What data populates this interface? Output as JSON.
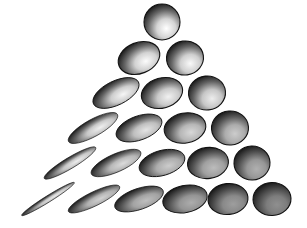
{
  "figure": {
    "title": "Triangular array of shaded ellipsoids",
    "width": 307,
    "height": 228,
    "background_color": "#ffffff",
    "rows": 6,
    "shape_count": 21
  },
  "palette": {
    "background": "#ffffff",
    "rim_dark": "#111111",
    "shade_dark": "#3a3a3a",
    "shade_mid": "#8e8e8e",
    "highlight": "#ffffff",
    "bottom_right_fill": "#6f6f6f"
  },
  "lighting": {
    "highlight_offset_x_pct": 62,
    "highlight_offset_y_pct": 68,
    "rim_direction": "top-left"
  },
  "chart_data": {
    "type": "scatter",
    "title": "Triangular array of shaded ellipsoids",
    "xlabel": "",
    "ylabel": "",
    "xlim": [
      0,
      307
    ],
    "ylim": [
      0,
      228
    ],
    "grid": false,
    "legend": "none",
    "shapes": [
      {
        "id": "r1c1",
        "row": 1,
        "col": 1,
        "cx": 162,
        "cy": 22,
        "rx": 18,
        "ry": 18,
        "angle": 0,
        "dark": 0.0
      },
      {
        "id": "r2c1",
        "row": 2,
        "col": 1,
        "cx": 139,
        "cy": 58,
        "rx": 21.5,
        "ry": 15.5,
        "angle": -22,
        "dark": 0.02
      },
      {
        "id": "r2c2",
        "row": 2,
        "col": 2,
        "cx": 185,
        "cy": 58,
        "rx": 18.5,
        "ry": 17,
        "angle": -8,
        "dark": 0.04
      },
      {
        "id": "r3c1",
        "row": 3,
        "col": 1,
        "cx": 116,
        "cy": 93,
        "rx": 25,
        "ry": 12,
        "angle": -26,
        "dark": 0.06
      },
      {
        "id": "r3c2",
        "row": 3,
        "col": 2,
        "cx": 162,
        "cy": 93,
        "rx": 21,
        "ry": 15,
        "angle": -16,
        "dark": 0.09
      },
      {
        "id": "r3c3",
        "row": 3,
        "col": 3,
        "cx": 207,
        "cy": 93,
        "rx": 18.5,
        "ry": 17,
        "angle": -6,
        "dark": 0.12
      },
      {
        "id": "r4c1",
        "row": 4,
        "col": 1,
        "cx": 93,
        "cy": 128,
        "rx": 28,
        "ry": 8.5,
        "angle": -29,
        "dark": 0.1
      },
      {
        "id": "r4c2",
        "row": 4,
        "col": 2,
        "cx": 139,
        "cy": 128,
        "rx": 24,
        "ry": 12,
        "angle": -20,
        "dark": 0.18
      },
      {
        "id": "r4c3",
        "row": 4,
        "col": 3,
        "cx": 185,
        "cy": 128,
        "rx": 21,
        "ry": 15,
        "angle": -11,
        "dark": 0.26
      },
      {
        "id": "r4c4",
        "row": 4,
        "col": 4,
        "cx": 230,
        "cy": 128,
        "rx": 18.5,
        "ry": 17,
        "angle": -4,
        "dark": 0.34
      },
      {
        "id": "r5c1",
        "row": 5,
        "col": 1,
        "cx": 70,
        "cy": 163,
        "rx": 30,
        "ry": 5.5,
        "angle": -31,
        "dark": 0.12
      },
      {
        "id": "r5c2",
        "row": 5,
        "col": 2,
        "cx": 116,
        "cy": 163,
        "rx": 27,
        "ry": 9,
        "angle": -24,
        "dark": 0.24
      },
      {
        "id": "r5c3",
        "row": 5,
        "col": 3,
        "cx": 162,
        "cy": 163,
        "rx": 23.5,
        "ry": 12.5,
        "angle": -16,
        "dark": 0.34
      },
      {
        "id": "r5c4",
        "row": 5,
        "col": 4,
        "cx": 208,
        "cy": 163,
        "rx": 20.5,
        "ry": 15.5,
        "angle": -8,
        "dark": 0.44
      },
      {
        "id": "r5c5",
        "row": 5,
        "col": 5,
        "cx": 252,
        "cy": 163,
        "rx": 18,
        "ry": 17,
        "angle": -2,
        "dark": 0.52
      },
      {
        "id": "r6c1",
        "row": 6,
        "col": 1,
        "cx": 48,
        "cy": 199,
        "rx": 31,
        "ry": 3.2,
        "angle": -32,
        "dark": 0.14
      },
      {
        "id": "r6c2",
        "row": 6,
        "col": 2,
        "cx": 94,
        "cy": 199,
        "rx": 28.5,
        "ry": 7,
        "angle": -26,
        "dark": 0.3
      },
      {
        "id": "r6c3",
        "row": 6,
        "col": 3,
        "cx": 139,
        "cy": 199,
        "rx": 25.5,
        "ry": 10.5,
        "angle": -19,
        "dark": 0.42
      },
      {
        "id": "r6c4",
        "row": 6,
        "col": 4,
        "cx": 185,
        "cy": 199,
        "rx": 22.5,
        "ry": 13.5,
        "angle": -12,
        "dark": 0.54
      },
      {
        "id": "r6c5",
        "row": 6,
        "col": 5,
        "cx": 228,
        "cy": 199,
        "rx": 20,
        "ry": 15.5,
        "angle": -6,
        "dark": 0.64
      },
      {
        "id": "r6c6",
        "row": 6,
        "col": 6,
        "cx": 272,
        "cy": 199,
        "rx": 19,
        "ry": 16.5,
        "angle": -2,
        "dark": 0.74
      }
    ]
  }
}
